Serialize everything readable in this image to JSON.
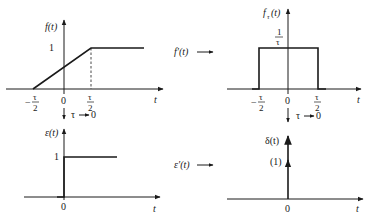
{
  "figure": {
    "type": "signal-derivative-diagram",
    "panels": {
      "top_left": {
        "ylabel": "f(t)",
        "xlabel": "t",
        "y_tick": "1",
        "x_ticks": [
          "-τ/2",
          "0",
          "τ/2"
        ],
        "description": "ramp from -τ/2 to τ/2 reaching 1, then constant 1"
      },
      "top_right": {
        "ylabel_main": "f",
        "ylabel_sub": "τ",
        "ylabel_arg": "(t)",
        "xlabel": "t",
        "height_num": "1",
        "height_den": "τ",
        "x_ticks": [
          "-τ/2",
          "0",
          "τ/2"
        ],
        "description": "rectangular pulse of height 1/τ from -τ/2 to τ/2"
      },
      "bottom_left": {
        "ylabel": "ε(t)",
        "xlabel": "t",
        "y_tick": "1",
        "x_ticks": [
          "0"
        ],
        "description": "unit step"
      },
      "bottom_right": {
        "ylabel": "δ(t)",
        "xlabel": "t",
        "weight": "(1)",
        "x_ticks": [
          "0"
        ],
        "description": "unit impulse"
      }
    },
    "annotations": {
      "deriv_top": "f′(t)",
      "deriv_bottom": "ε′(t)",
      "limit_left": "τ",
      "limit_left_to": "0",
      "limit_right": "τ",
      "limit_right_to": "0"
    },
    "tick_text": {
      "tau": "τ",
      "two": "2",
      "minus": "−",
      "zero": "0",
      "one": "1"
    }
  }
}
